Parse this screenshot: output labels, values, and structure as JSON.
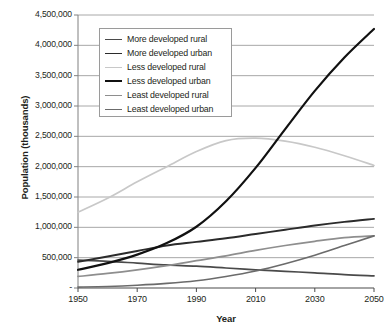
{
  "chart_data": {
    "type": "line",
    "title": "",
    "xlabel": "Year",
    "ylabel": "Population (thousands)",
    "xlim": [
      1950,
      2050
    ],
    "ylim": [
      0,
      4500000
    ],
    "grid": true,
    "legend_position": "top-left-inside",
    "x_ticks": [
      "1950",
      "1970",
      "1990",
      "2010",
      "2030",
      "2050"
    ],
    "x_tick_values": [
      1950,
      1970,
      1990,
      2010,
      2030,
      2050
    ],
    "y_ticks": [
      "-",
      "500,000",
      "1,000,000",
      "1,500,000",
      "2,000,000",
      "2,500,000",
      "3,000,000",
      "3,500,000",
      "4,000,000",
      "4,500,000"
    ],
    "y_tick_values": [
      0,
      500000,
      1000000,
      1500000,
      2000000,
      2500000,
      3000000,
      3500000,
      4000000,
      4500000
    ],
    "x": [
      1950,
      1960,
      1970,
      1980,
      1990,
      2000,
      2010,
      2020,
      2030,
      2040,
      2050
    ],
    "series": [
      {
        "name": "More developed rural",
        "color": "#4a4a4a",
        "width": 1.7,
        "values": [
          460000,
          440000,
          410000,
          380000,
          360000,
          330000,
          300000,
          275000,
          250000,
          220000,
          200000
        ]
      },
      {
        "name": "More developed urban",
        "color": "#2b2b2b",
        "width": 1.9,
        "values": [
          430000,
          520000,
          610000,
          700000,
          760000,
          820000,
          890000,
          960000,
          1030000,
          1090000,
          1140000
        ]
      },
      {
        "name": "Less developed rural",
        "color": "#c8c8c8",
        "width": 1.7,
        "values": [
          1250000,
          1480000,
          1750000,
          2000000,
          2250000,
          2430000,
          2470000,
          2420000,
          2320000,
          2180000,
          2020000
        ]
      },
      {
        "name": "Less developed urban",
        "color": "#111111",
        "width": 2.2,
        "values": [
          300000,
          410000,
          550000,
          740000,
          1010000,
          1430000,
          1980000,
          2620000,
          3250000,
          3800000,
          4270000
        ]
      },
      {
        "name": "Least developed rural",
        "color": "#8e8e8e",
        "width": 1.7,
        "values": [
          190000,
          240000,
          300000,
          370000,
          450000,
          530000,
          620000,
          700000,
          770000,
          830000,
          860000
        ]
      },
      {
        "name": "Least developed urban",
        "color": "#6b6b6b",
        "width": 1.7,
        "values": [
          15000,
          25000,
          45000,
          75000,
          120000,
          190000,
          280000,
          400000,
          540000,
          700000,
          860000
        ]
      }
    ],
    "axis_color": "#808080",
    "grid_color": "#a8a8a8",
    "background": "#ffffff"
  }
}
